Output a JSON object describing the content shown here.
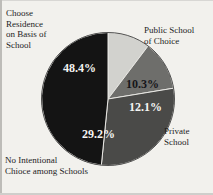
{
  "chart_data": {
    "type": "pie",
    "title": "",
    "subtitle": "",
    "xlabel": "",
    "ylabel": "",
    "legend_position": "none",
    "grid": false,
    "units": "percent",
    "categories": [
      "Public School of Choice",
      "Private School",
      "No Intentional Chioce among Schools",
      "Choose Residence on Basis of School"
    ],
    "values": [
      10.3,
      12.1,
      29.2,
      48.4
    ],
    "value_labels": [
      "10.3%",
      "12.1%",
      "29.2%",
      "48.4%"
    ],
    "colors": [
      "#d2d2ce",
      "#6e6e6b",
      "#4a4a48",
      "#141414"
    ],
    "slices": [
      {
        "label": "Public School of Choice",
        "label_lines": [
          "Public School",
          "of Choice"
        ],
        "value": 10.3,
        "value_label": "10.3%",
        "color": "#d2d2ce",
        "value_text_color": "#16161a",
        "start_angle": 0,
        "end_angle": 37.08
      },
      {
        "label": "Private School",
        "label_lines": [
          "Private",
          "School"
        ],
        "value": 12.1,
        "value_label": "12.1%",
        "color": "#6e6e6b",
        "value_text_color": "#f4f4f2",
        "start_angle": 37.08,
        "end_angle": 80.64
      },
      {
        "label": "No Intentional Chioce among Schools",
        "label_lines": [
          "No Intentional",
          "Chioce among Schools"
        ],
        "value": 29.2,
        "value_label": "29.2%",
        "color": "#4a4a48",
        "value_text_color": "#f4f4f2",
        "start_angle": 80.64,
        "end_angle": 185.76
      },
      {
        "label": "Choose Residence on Basis of School",
        "label_lines": [
          "Choose",
          "Residence",
          "on Basis of",
          "School"
        ],
        "value": 48.4,
        "value_label": "48.4%",
        "color": "#141414",
        "value_text_color": "#f4f4f2",
        "start_angle": 185.76,
        "end_angle": 360
      }
    ]
  },
  "labels": {
    "residence_line1": "Choose",
    "residence_line2": "Residence",
    "residence_line3": "on Basis of",
    "residence_line4": "School",
    "public_line1": "Public School",
    "public_line2": "of Choice",
    "private_line1": "Private",
    "private_line2": "School",
    "nointent_line1": "No Intentional",
    "nointent_line2": "Chioce among Schools"
  },
  "values": {
    "residence": "48.4%",
    "public": "10.3%",
    "private": "12.1%",
    "nointent": "29.2%"
  }
}
